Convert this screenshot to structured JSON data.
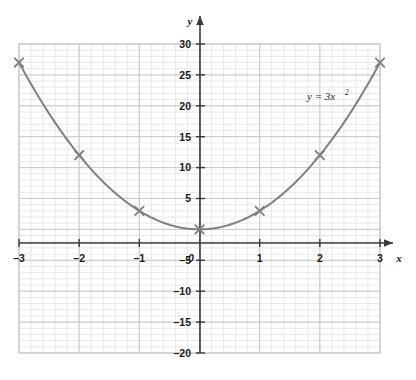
{
  "chart_data": {
    "type": "line",
    "title": "",
    "equation_label": "y = 3x",
    "equation_exponent": "2",
    "xlabel": "x",
    "ylabel": "y",
    "xlim": [
      -3,
      3
    ],
    "ylim": [
      -20,
      30
    ],
    "x_ticks": [
      "-3",
      "-2",
      "-1",
      "0",
      "1",
      "2",
      "3"
    ],
    "x_tick_values": [
      -3,
      -2,
      -1,
      0,
      1,
      2,
      3
    ],
    "y_ticks": [
      "30",
      "25",
      "20",
      "15",
      "10",
      "5",
      "-5",
      "-10",
      "-15",
      "-20"
    ],
    "y_tick_values": [
      30,
      25,
      20,
      15,
      10,
      5,
      -5,
      -10,
      -15,
      -20
    ],
    "origin_label": "0",
    "grid": "minor-and-major",
    "minor_grid_step_x": 0.2,
    "minor_grid_step_y": 1,
    "major_grid_step_x": 1,
    "major_grid_step_y": 5,
    "legend": "none",
    "series": [
      {
        "name": "y = 3x^2",
        "marker": "cross",
        "color": "#808080",
        "x": [
          -3,
          -2,
          -1,
          0,
          1,
          2,
          3
        ],
        "values": [
          27,
          12,
          3,
          0,
          3,
          12,
          27
        ]
      }
    ],
    "curve_color": "#808080",
    "axis_color": "#3a3a3a",
    "major_grid_color": "#c9c9c9",
    "minor_grid_color": "#e8e8e8"
  }
}
